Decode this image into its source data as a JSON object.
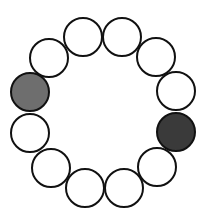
{
  "diagram": {
    "type": "circle-ring",
    "circle_count": 12,
    "radius": 19,
    "stroke_color": "#111111",
    "stroke_width": 2,
    "colors": {
      "white": "#ffffff",
      "gray": "#6e6e6e",
      "dark": "#3a3a3a"
    },
    "circles": [
      {
        "position": "top-left",
        "cx": 83,
        "cy": 37,
        "fill": "white"
      },
      {
        "position": "top-right",
        "cx": 122,
        "cy": 37,
        "fill": "white"
      },
      {
        "position": "upper-right",
        "cx": 156,
        "cy": 57,
        "fill": "white"
      },
      {
        "position": "right-upper",
        "cx": 176,
        "cy": 91,
        "fill": "white"
      },
      {
        "position": "right-lower",
        "cx": 176,
        "cy": 132,
        "fill": "dark"
      },
      {
        "position": "lower-right",
        "cx": 157,
        "cy": 167,
        "fill": "white"
      },
      {
        "position": "bottom-right",
        "cx": 124,
        "cy": 188,
        "fill": "white"
      },
      {
        "position": "bottom-left",
        "cx": 85,
        "cy": 188,
        "fill": "white"
      },
      {
        "position": "lower-left",
        "cx": 51,
        "cy": 168,
        "fill": "white"
      },
      {
        "position": "left-lower",
        "cx": 30,
        "cy": 133,
        "fill": "white"
      },
      {
        "position": "left-upper",
        "cx": 30,
        "cy": 92,
        "fill": "gray"
      },
      {
        "position": "upper-left",
        "cx": 49,
        "cy": 58,
        "fill": "white"
      }
    ]
  }
}
